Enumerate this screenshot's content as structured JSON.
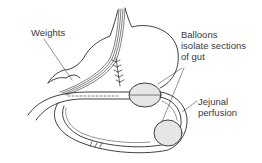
{
  "diagram": {
    "labels": {
      "weights": "Weights",
      "balloons_line1": "Balloons",
      "balloons_line2": "isolate sections",
      "balloons_line3": "of gut",
      "jejunal_line1": "Jejunal",
      "jejunal_line2": "perfusion"
    },
    "colors": {
      "line": "#2b2b2b",
      "balloon_fill": "#e6e6e6",
      "text": "#3a3a3a",
      "background": "#ffffff"
    }
  }
}
